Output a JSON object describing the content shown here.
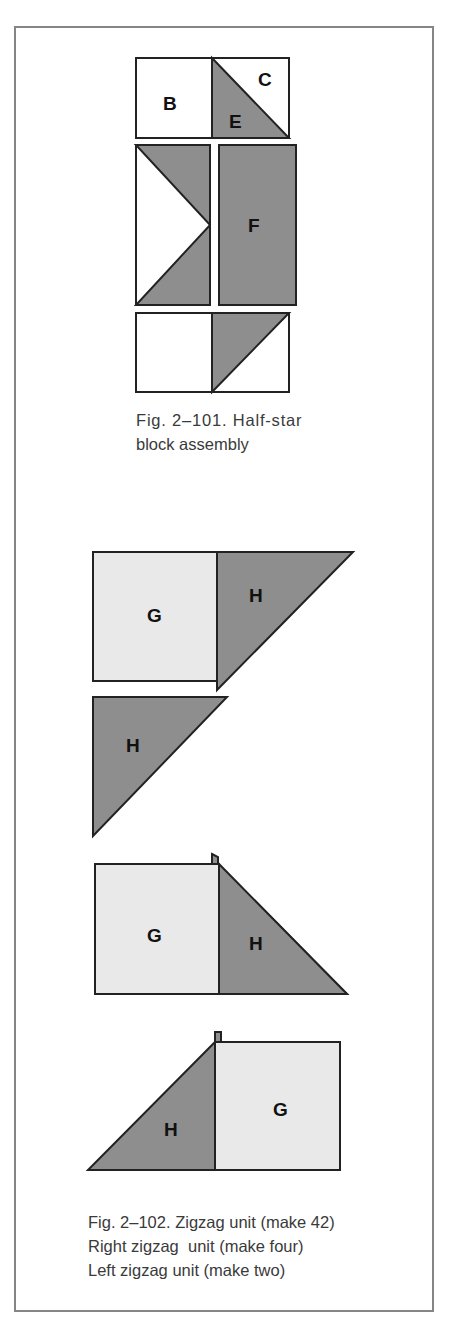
{
  "figure_101": {
    "caption_line1": "Fig. 2–101. Half-star",
    "caption_line2": "block assembly",
    "labels": {
      "b": "B",
      "c": "C",
      "e": "E",
      "f": "F"
    }
  },
  "figure_102": {
    "caption_line1": "Fig. 2–102. Zigzag unit (make 42)",
    "caption_line2": "Right zigzag  unit (make four)",
    "caption_line3": "Left zigzag unit (make two)",
    "labels": {
      "g1": "G",
      "h1": "H",
      "h2": "H",
      "g2": "G",
      "h3": "H",
      "h4": "H",
      "g3": "G"
    }
  },
  "colors": {
    "dark_fabric": "#8e8e8e",
    "light_fabric": "#e9e9e9",
    "outline": "#222222",
    "frame": "#858585"
  }
}
